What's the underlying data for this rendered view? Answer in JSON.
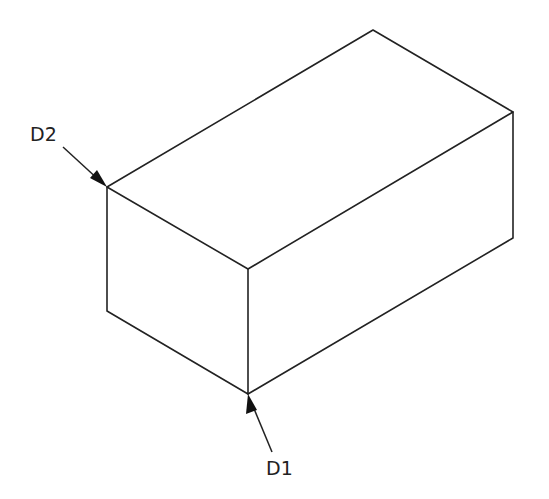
{
  "diagram": {
    "type": "isometric-rectangular-block",
    "colors": {
      "line": "#222222",
      "background": "#ffffff"
    },
    "vertices": {
      "top_back": [
        373,
        30
      ],
      "top_right": [
        513,
        112
      ],
      "top_front": [
        248,
        269
      ],
      "top_left": [
        107,
        187
      ],
      "bottom_right": [
        513,
        238
      ],
      "bottom_front": [
        248,
        394
      ],
      "bottom_left": [
        107,
        311
      ]
    },
    "labels": [
      {
        "id": "D2",
        "text": "D2",
        "position": [
          30,
          140
        ],
        "arrow_from": [
          63,
          147
        ],
        "arrow_to": [
          107,
          187
        ]
      },
      {
        "id": "D1",
        "text": "D1",
        "position": [
          266,
          474
        ],
        "arrow_from": [
          272,
          452
        ],
        "arrow_to": [
          248,
          394
        ]
      }
    ]
  }
}
